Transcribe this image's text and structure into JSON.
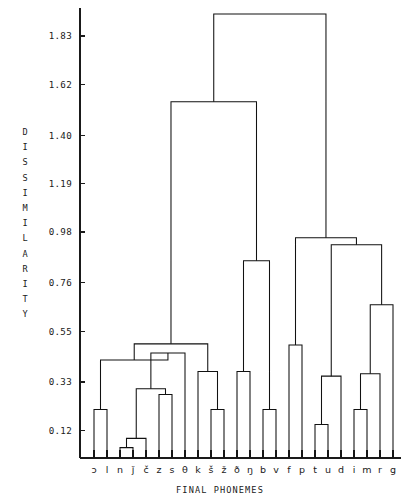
{
  "chart_data": {
    "type": "dendrogram",
    "title": "",
    "xlabel": "FINAL PHONEMES",
    "ylabel": "DISSIMILARITY",
    "ylabel_chars": [
      "D",
      "I",
      "S",
      "S",
      "I",
      "M",
      "I",
      "L",
      "A",
      "R",
      "I",
      "T",
      "Y"
    ],
    "grid": false,
    "legend": null,
    "ylim": [
      0.0,
      1.95
    ],
    "ytick_values": [
      0.12,
      0.33,
      0.55,
      0.76,
      0.98,
      1.19,
      1.4,
      1.62,
      1.83
    ],
    "ytick_labels": [
      "0.12",
      "0.33",
      "0.55",
      "0.76",
      "0.98",
      "1.19",
      "1.40",
      "1.62",
      "1.83"
    ],
    "leaf_order": [
      "ɔ",
      "l",
      "n",
      "ǰ",
      "č",
      "z",
      "s",
      "θ",
      "k",
      "š",
      "ž",
      "ð",
      "ŋ",
      "b",
      "v",
      "f",
      "p",
      "t",
      "u",
      "d",
      "i",
      "m",
      "r",
      "g"
    ],
    "leaf_count": 24,
    "merges": [
      {
        "id": "m1",
        "left": {
          "type": "leaf",
          "index": 0
        },
        "right": {
          "type": "leaf",
          "index": 1
        },
        "height": 0.21
      },
      {
        "id": "m2",
        "left": {
          "type": "leaf",
          "index": 2
        },
        "right": {
          "type": "leaf",
          "index": 3
        },
        "height": 0.045
      },
      {
        "id": "m3",
        "left": {
          "type": "leaf",
          "index": 4
        },
        "right": {
          "type": "node",
          "id": "m2"
        },
        "height": 0.085
      },
      {
        "id": "m4",
        "left": {
          "type": "leaf",
          "index": 5
        },
        "right": {
          "type": "leaf",
          "index": 6
        },
        "height": 0.275
      },
      {
        "id": "m5",
        "left": {
          "type": "node",
          "id": "m3"
        },
        "right": {
          "type": "node",
          "id": "m4"
        },
        "height": 0.3
      },
      {
        "id": "m6",
        "left": {
          "type": "leaf",
          "index": 7
        },
        "right": {
          "type": "node",
          "id": "m5"
        },
        "height": 0.455
      },
      {
        "id": "m7",
        "left": {
          "type": "node",
          "id": "m1"
        },
        "right": {
          "type": "node",
          "id": "m6"
        },
        "height": 0.425
      },
      {
        "id": "m8",
        "left": {
          "type": "leaf",
          "index": 9
        },
        "right": {
          "type": "leaf",
          "index": 10
        },
        "height": 0.21
      },
      {
        "id": "m9",
        "left": {
          "type": "leaf",
          "index": 8
        },
        "right": {
          "type": "node",
          "id": "m8"
        },
        "height": 0.375
      },
      {
        "id": "m10",
        "left": {
          "type": "node",
          "id": "m7"
        },
        "right": {
          "type": "node",
          "id": "m9"
        },
        "height": 0.495
      },
      {
        "id": "m11",
        "left": {
          "type": "leaf",
          "index": 11
        },
        "right": {
          "type": "leaf",
          "index": 12
        },
        "height": 0.375
      },
      {
        "id": "m12",
        "left": {
          "type": "leaf",
          "index": 13
        },
        "right": {
          "type": "leaf",
          "index": 14
        },
        "height": 0.21
      },
      {
        "id": "m13",
        "left": {
          "type": "node",
          "id": "m11"
        },
        "right": {
          "type": "node",
          "id": "m12"
        },
        "height": 0.855
      },
      {
        "id": "m14",
        "left": {
          "type": "node",
          "id": "m10"
        },
        "right": {
          "type": "node",
          "id": "m13"
        },
        "height": 1.545
      },
      {
        "id": "m15",
        "left": {
          "type": "leaf",
          "index": 15
        },
        "right": {
          "type": "leaf",
          "index": 16
        },
        "height": 0.49
      },
      {
        "id": "m16",
        "left": {
          "type": "leaf",
          "index": 17
        },
        "right": {
          "type": "leaf",
          "index": 18
        },
        "height": 0.145
      },
      {
        "id": "m17",
        "left": {
          "type": "node",
          "id": "m16"
        },
        "right": {
          "type": "leaf",
          "index": 19
        },
        "height": 0.355
      },
      {
        "id": "m18",
        "left": {
          "type": "leaf",
          "index": 20
        },
        "right": {
          "type": "leaf",
          "index": 21
        },
        "height": 0.21
      },
      {
        "id": "m19",
        "left": {
          "type": "node",
          "id": "m18"
        },
        "right": {
          "type": "leaf",
          "index": 22
        },
        "height": 0.365
      },
      {
        "id": "m20",
        "left": {
          "type": "node",
          "id": "m19"
        },
        "right": {
          "type": "leaf",
          "index": 23
        },
        "height": 0.665
      },
      {
        "id": "m21",
        "left": {
          "type": "node",
          "id": "m17"
        },
        "right": {
          "type": "node",
          "id": "m20"
        },
        "height": 0.925
      },
      {
        "id": "m22",
        "left": {
          "type": "node",
          "id": "m15"
        },
        "right": {
          "type": "node",
          "id": "m21"
        },
        "height": 0.955
      },
      {
        "id": "m23",
        "left": {
          "type": "node",
          "id": "m14"
        },
        "right": {
          "type": "node",
          "id": "m22"
        },
        "height": 1.925
      }
    ]
  }
}
